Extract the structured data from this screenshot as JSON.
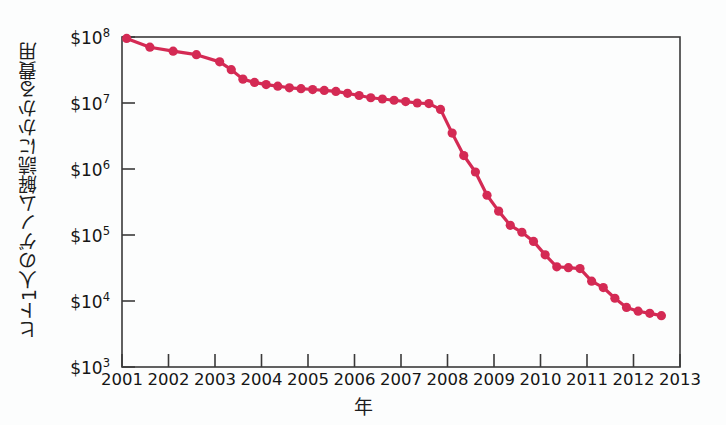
{
  "meta": {
    "title": "",
    "accent_color": "#d42a54",
    "axis_color": "#3a3a3a",
    "background_color": "#fcfdfd",
    "text_color": "#151515"
  },
  "axes": {
    "ylabel": "ヒト1人のゲノム解読にかかる費用",
    "xlabel": "年",
    "y_ticks": [
      {
        "label_base": "$10",
        "label_exp": "8",
        "value": 100000000
      },
      {
        "label_base": "$10",
        "label_exp": "7",
        "value": 10000000
      },
      {
        "label_base": "$10",
        "label_exp": "6",
        "value": 1000000
      },
      {
        "label_base": "$10",
        "label_exp": "5",
        "value": 100000
      },
      {
        "label_base": "$10",
        "label_exp": "4",
        "value": 10000
      },
      {
        "label_base": "$10",
        "label_exp": "3",
        "value": 1000
      }
    ],
    "x_ticks": [
      "2001",
      "2002",
      "2003",
      "2004",
      "2005",
      "2006",
      "2007",
      "2008",
      "2009",
      "2010",
      "2011",
      "2012",
      "2013"
    ]
  },
  "chart_data": {
    "type": "line",
    "title": "",
    "subtitle": "",
    "xlabel": "年",
    "ylabel": "ヒト1人のゲノム解読にかかる費用",
    "yscale": "log",
    "ylim": [
      1000,
      100000000
    ],
    "xlim": [
      2001,
      2013
    ],
    "grid": false,
    "legend": null,
    "marker": "circle",
    "line_color": "#d42a54",
    "marker_color": "#d42a54",
    "y_tick_values": [
      1000,
      10000,
      100000,
      1000000,
      10000000,
      100000000
    ],
    "y_tick_labels": [
      "$10^3",
      "$10^4",
      "$10^5",
      "$10^6",
      "$10^7",
      "$10^8"
    ],
    "x_tick_values": [
      2001,
      2002,
      2003,
      2004,
      2005,
      2006,
      2007,
      2008,
      2009,
      2010,
      2011,
      2012,
      2013
    ],
    "x_tick_labels": [
      "2001",
      "2002",
      "2003",
      "2004",
      "2005",
      "2006",
      "2007",
      "2008",
      "2009",
      "2010",
      "2011",
      "2012",
      "2013"
    ],
    "series": [
      {
        "name": "ヒト1人のゲノム解読にかかる費用",
        "x": [
          2001.1,
          2001.6,
          2002.1,
          2002.6,
          2003.1,
          2003.35,
          2003.6,
          2003.85,
          2004.1,
          2004.35,
          2004.6,
          2004.85,
          2005.1,
          2005.35,
          2005.6,
          2005.85,
          2006.1,
          2006.35,
          2006.6,
          2006.85,
          2007.1,
          2007.35,
          2007.6,
          2007.85,
          2008.1,
          2008.35,
          2008.6,
          2008.85,
          2009.1,
          2009.35,
          2009.6,
          2009.85,
          2010.1,
          2010.35,
          2010.6,
          2010.85,
          2011.1,
          2011.35,
          2011.6,
          2011.85,
          2012.1,
          2012.35,
          2012.6
        ],
        "y": [
          95000000,
          70000000,
          61000000,
          54000000,
          42000000,
          32000000,
          23000000,
          20500000,
          19000000,
          18000000,
          17000000,
          16500000,
          16000000,
          15500000,
          15000000,
          14000000,
          13000000,
          12000000,
          11500000,
          11000000,
          10500000,
          10000000,
          9800000,
          8000000,
          3500000,
          1600000,
          900000,
          400000,
          230000,
          140000,
          110000,
          80000,
          50000,
          33000,
          32000,
          31000,
          20000,
          16000,
          11000,
          8000,
          7000,
          6500,
          6000
        ],
        "color": "#d42a54"
      }
    ]
  }
}
